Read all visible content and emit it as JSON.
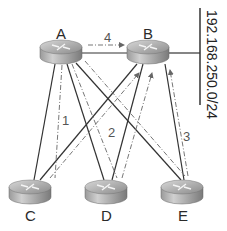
{
  "diagram": {
    "type": "network-topology",
    "routers": [
      {
        "id": "A",
        "label": "A",
        "x": 61,
        "y": 51
      },
      {
        "id": "B",
        "label": "B",
        "x": 148,
        "y": 51
      },
      {
        "id": "C",
        "label": "C",
        "x": 30,
        "y": 191
      },
      {
        "id": "D",
        "label": "D",
        "x": 106,
        "y": 191
      },
      {
        "id": "E",
        "label": "E",
        "x": 182,
        "y": 191
      }
    ],
    "physical_links": [
      [
        "A",
        "B"
      ],
      [
        "A",
        "C"
      ],
      [
        "A",
        "D"
      ],
      [
        "A",
        "E"
      ],
      [
        "B",
        "C"
      ],
      [
        "B",
        "D"
      ],
      [
        "B",
        "E"
      ],
      [
        "B",
        "network"
      ]
    ],
    "flows": [
      {
        "label": "1",
        "from": "A",
        "to": "C"
      },
      {
        "label": "2",
        "from": "A",
        "to": "D"
      },
      {
        "label": "3",
        "from": "A",
        "to": "E"
      },
      {
        "label": "4",
        "from": "A",
        "to": "B"
      }
    ],
    "network": {
      "label": "192.168.250.0/24"
    },
    "colors": {
      "line": "#333333",
      "dash": "#777777"
    }
  }
}
